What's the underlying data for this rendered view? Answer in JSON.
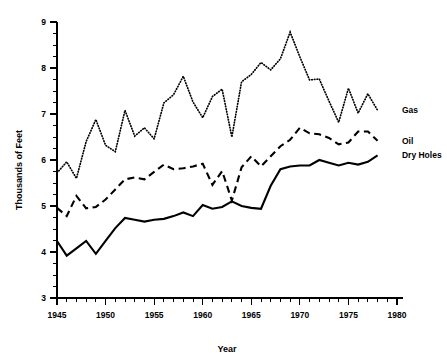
{
  "chart_data": {
    "type": "line",
    "title": "",
    "xlabel": "Year",
    "ylabel": "Thousands of Feet",
    "xlim": [
      1945,
      1980
    ],
    "ylim": [
      3,
      9
    ],
    "grid": false,
    "legend_position": "right-inline",
    "x_ticks_major": [
      1945,
      1950,
      1955,
      1960,
      1965,
      1970,
      1975,
      1980
    ],
    "x_tick_labels": [
      "1945",
      "1950",
      "1955",
      "1960",
      "1965",
      "1970",
      "1975",
      "1980"
    ],
    "x_tick_interval_minor": 1,
    "y_ticks_major": [
      3,
      4,
      5,
      6,
      7,
      8,
      9
    ],
    "y_tick_labels": [
      "3",
      "4",
      "5",
      "6",
      "7",
      "8",
      "9"
    ],
    "y_tick_interval_minor": 0.25,
    "x": [
      1945,
      1946,
      1947,
      1948,
      1949,
      1950,
      1951,
      1952,
      1953,
      1954,
      1955,
      1956,
      1957,
      1958,
      1959,
      1960,
      1961,
      1962,
      1963,
      1964,
      1965,
      1966,
      1967,
      1968,
      1969,
      1970,
      1971,
      1972,
      1973,
      1974,
      1975,
      1976,
      1977,
      1978
    ],
    "series": [
      {
        "name": "Gas",
        "style": "dotted",
        "values": [
          5.72,
          5.96,
          5.6,
          6.4,
          6.88,
          6.32,
          6.18,
          7.08,
          6.52,
          6.7,
          6.46,
          7.24,
          7.42,
          7.82,
          7.26,
          6.92,
          7.38,
          7.54,
          6.5,
          7.7,
          7.86,
          8.12,
          7.96,
          8.2,
          8.78,
          8.24,
          7.74,
          7.76,
          7.28,
          6.82,
          7.56,
          7.02,
          7.44,
          7.08
        ]
      },
      {
        "name": "Oil",
        "style": "dashed",
        "values": [
          4.96,
          4.78,
          5.22,
          4.95,
          4.98,
          5.14,
          5.36,
          5.58,
          5.62,
          5.58,
          5.74,
          5.9,
          5.8,
          5.82,
          5.86,
          5.92,
          5.46,
          5.76,
          5.12,
          5.84,
          6.08,
          5.86,
          6.08,
          6.3,
          6.44,
          6.7,
          6.58,
          6.56,
          6.48,
          6.34,
          6.38,
          6.62,
          6.62,
          6.42
        ]
      },
      {
        "name": "Dry Holes",
        "style": "solid",
        "values": [
          4.24,
          3.92,
          4.08,
          4.24,
          3.96,
          4.24,
          4.52,
          4.74,
          4.7,
          4.66,
          4.7,
          4.72,
          4.78,
          4.86,
          4.78,
          5.02,
          4.94,
          4.98,
          5.1,
          5.0,
          4.96,
          4.94,
          5.44,
          5.8,
          5.86,
          5.88,
          5.88,
          6.0,
          5.94,
          5.88,
          5.94,
          5.9,
          5.96,
          6.1
        ]
      }
    ],
    "annotations": [
      {
        "text": "Gas",
        "x": 1980.2,
        "y": 7.08
      },
      {
        "text": "Oil",
        "x": 1980.2,
        "y": 6.42
      },
      {
        "text": "Dry Holes",
        "x": 1980.2,
        "y": 6.1
      }
    ]
  },
  "axes": {
    "y_title": "Thousands of Feet",
    "x_title": "Year"
  },
  "legend": {
    "gas": "Gas",
    "oil": "Oil",
    "dry_holes": "Dry Holes"
  }
}
